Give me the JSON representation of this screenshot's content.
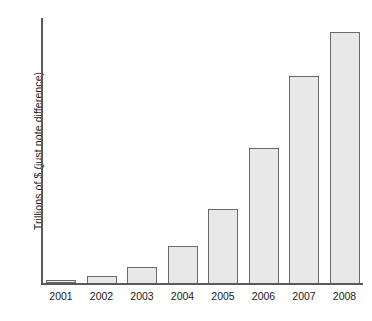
{
  "chart_data": {
    "type": "bar",
    "title": "",
    "subtitle": "",
    "xlabel": "",
    "ylabel": "Trillions of $ (just note difference)",
    "categories": [
      "2001",
      "2002",
      "2003",
      "2004",
      "2005",
      "2006",
      "2007",
      "2008"
    ],
    "values": [
      0.1,
      0.25,
      0.6,
      1.4,
      2.8,
      5.1,
      7.8,
      9.5
    ],
    "series": [
      {
        "name": "Trillions of $",
        "values": [
          0.1,
          0.25,
          0.6,
          1.4,
          2.8,
          5.1,
          7.8,
          9.5
        ]
      }
    ],
    "bar_fractions": [
      0.012,
      0.026,
      0.06,
      0.139,
      0.278,
      0.511,
      0.782,
      0.947
    ],
    "ylim": [
      0,
      10
    ],
    "y_ticks": [],
    "y_tick_labels": [],
    "grid": false,
    "legend": false,
    "legend_position": "none",
    "annotations": [],
    "colors": {
      "bar_fill": "#e8e8e8",
      "bar_border": "#6a6a6a",
      "axis": "#5a5a5a",
      "text": "#1a1a1a",
      "background": "#ffffff"
    }
  }
}
